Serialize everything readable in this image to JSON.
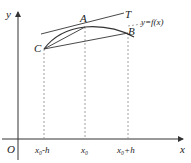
{
  "diagram": {
    "axes": {
      "x_label": "x",
      "y_label": "y",
      "origin_label": "O"
    },
    "points": {
      "A": "A",
      "B": "B",
      "C": "C",
      "T": "T"
    },
    "curve_label": "y=f(x)",
    "ticks": [
      "x₀-h",
      "x₀",
      "x₀+h"
    ]
  }
}
